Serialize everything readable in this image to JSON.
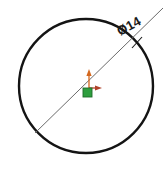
{
  "drawing": {
    "title": "Circle with diameter dimension",
    "background_color": "#ffffff",
    "canvas": {
      "width": 168,
      "height": 169
    }
  },
  "circle": {
    "name": "circle-profile",
    "center_x": 86,
    "center_y": 86,
    "radius": 67,
    "stroke_color": "#141414",
    "stroke_width": 2.4
  },
  "dimension": {
    "label": "Ø14",
    "symbol": "Ø",
    "value": "14",
    "text_rotation_deg": -29,
    "text_x": 131,
    "text_y": 30,
    "leader": {
      "x1": 35,
      "y1": 133,
      "x2": 163,
      "y2": 8,
      "stroke_color": "#6b6b6b",
      "stroke_width": 1.0
    },
    "tick": {
      "x": 137,
      "y": 42,
      "stroke_color": "#1a1a1a"
    }
  },
  "origin_marker": {
    "name": "sketch-origin",
    "x": 89,
    "y": 88,
    "y_axis_arrow": {
      "label": "y-axis",
      "from_y": 88,
      "to_y": 71,
      "color": "#d4681e"
    },
    "x_axis_arrow": {
      "label": "x-axis",
      "from_x": 89,
      "to_x": 101,
      "color": "#b0422a"
    },
    "point_square": {
      "label": "origin-point",
      "x": 83,
      "y": 88,
      "size": 9,
      "fill_color": "#2e9e3e",
      "stroke_color": "#1d6b28"
    }
  }
}
